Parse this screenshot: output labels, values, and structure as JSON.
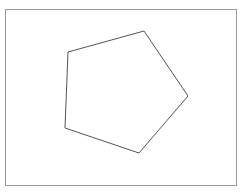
{
  "figure": {
    "canvas": {
      "width": 249,
      "height": 196,
      "background_color": "#ffffff"
    },
    "frame": {
      "label": "Rectangular border frame",
      "x": 5,
      "y": 9,
      "width": 231,
      "height": 176,
      "stroke_color": "#9a9a9a",
      "stroke_width": 1,
      "fill_color": "#ffffff"
    },
    "polygon": {
      "label": "Irregular pentagon",
      "sides": 5,
      "stroke_color": "#545454",
      "stroke_width": 1,
      "fill_color": "none",
      "points": "68,52 144,31 188,96 139,153 65,128",
      "vertices": [
        {
          "name": "top-left-vertex",
          "x": 68,
          "y": 52
        },
        {
          "name": "top-vertex",
          "x": 144,
          "y": 31
        },
        {
          "name": "right-vertex",
          "x": 188,
          "y": 96
        },
        {
          "name": "bottom-vertex",
          "x": 139,
          "y": 153
        },
        {
          "name": "bottom-left-vertex",
          "x": 65,
          "y": 128
        }
      ]
    }
  }
}
